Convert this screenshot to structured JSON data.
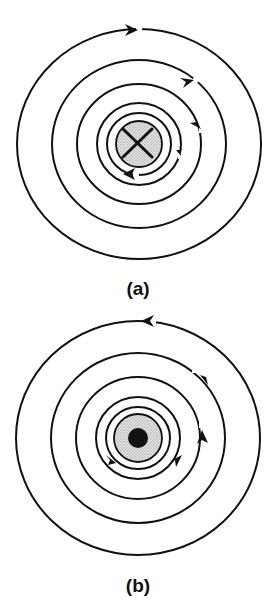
{
  "figure": {
    "panels": [
      {
        "id": "a",
        "label": "(a)",
        "center": [
          139,
          144
        ],
        "conductor_symbol": "cross",
        "description": "current into page, field lines clockwise",
        "rings": [
          {
            "rx": 122,
            "ry": 115
          },
          {
            "rx": 87,
            "ry": 84
          },
          {
            "rx": 62,
            "ry": 60
          },
          {
            "rx": 42,
            "ry": 41
          },
          {
            "rx": 32,
            "ry": 31
          }
        ],
        "core_radius": 23,
        "direction": "clockwise"
      },
      {
        "id": "b",
        "label": "(b)",
        "center": [
          138,
          438
        ],
        "conductor_symbol": "dot",
        "description": "current out of page, field lines counterclockwise",
        "rings": [
          {
            "rx": 122,
            "ry": 117
          },
          {
            "rx": 87,
            "ry": 85
          },
          {
            "rx": 62,
            "ry": 61
          },
          {
            "rx": 42,
            "ry": 41
          },
          {
            "rx": 32,
            "ry": 31
          }
        ],
        "core_radius": 24,
        "direction": "counterclockwise"
      }
    ],
    "colors": {
      "line": "#111111",
      "core_fill": "#cfcfcf"
    }
  }
}
